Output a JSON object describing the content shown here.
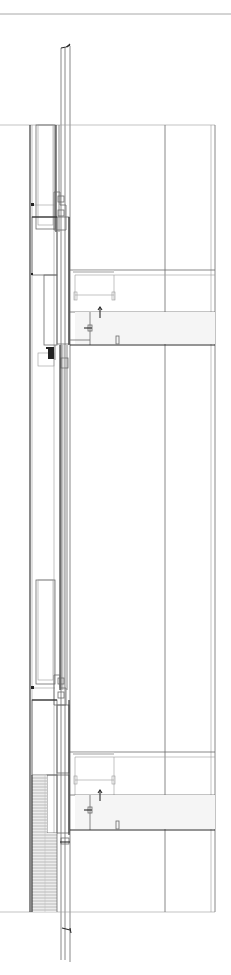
{
  "drawing": {
    "type": "architectural wall section",
    "orientation": "vertical",
    "background": "#ffffff",
    "line_color": "#6a6a6a",
    "dark_line_color": "#2a2a2a",
    "text_labels": []
  },
  "elements": {
    "top_rule_y": 14,
    "facade_top_y": 43,
    "facade_bottom_y": 960,
    "floor_band_top_y": 125,
    "floor_band_bottom_y": 912,
    "upper_window_y": [
      125,
      230
    ],
    "upper_insulation_y": [
      236,
      350
    ],
    "upper_slab_y": [
      268,
      345
    ],
    "main_glazing_y": [
      350,
      685
    ],
    "lower_window_y": [
      580,
      690
    ],
    "lower_insulation_y": [
      690,
      830
    ],
    "lower_slab_y": [
      752,
      830
    ],
    "brick_cladding_y": [
      772,
      912
    ],
    "column_lines_x": [
      165,
      211,
      215
    ]
  }
}
